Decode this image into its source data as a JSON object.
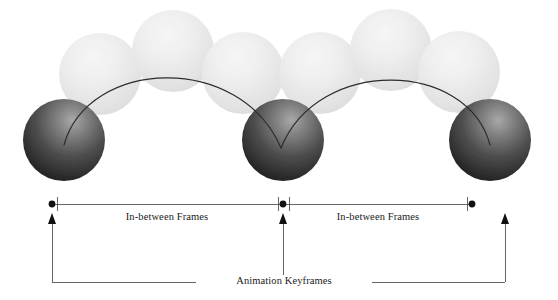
{
  "figure": {
    "type": "animation-keyframes-diagram",
    "background_color": "#ffffff",
    "width": 558,
    "height": 300
  },
  "labels": {
    "inbetween_left": "In-between Frames",
    "inbetween_right": "In-between Frames",
    "keyframes": "Animation Keyframes"
  },
  "colors": {
    "keyframe_ball_dark": "#1f1f1f",
    "keyframe_ball_highlight": "#9a9a9a",
    "inbetween_ball_light": "#e6e6e6",
    "inbetween_ball_highlight": "#f4f4f4",
    "trajectory_line": "#2b2b2b",
    "measure_line": "#555555",
    "bracket_line": "#555555",
    "marker_dot": "#111111",
    "text": "#1a1a1a"
  },
  "balls": {
    "keyframes": [
      {
        "name": "keyframe-ball-1",
        "cx": 64,
        "cy": 140,
        "r": 41
      },
      {
        "name": "keyframe-ball-2",
        "cx": 283,
        "cy": 140,
        "r": 41
      },
      {
        "name": "keyframe-ball-3",
        "cx": 490,
        "cy": 140,
        "r": 41
      }
    ],
    "inbetweens": [
      {
        "name": "inbetween-ball-1",
        "cx": 100,
        "cy": 74,
        "r": 41
      },
      {
        "name": "inbetween-ball-2",
        "cx": 173,
        "cy": 51,
        "r": 41
      },
      {
        "name": "inbetween-ball-3",
        "cx": 243,
        "cy": 73,
        "r": 41
      },
      {
        "name": "inbetween-ball-4",
        "cx": 320,
        "cy": 73,
        "r": 41
      },
      {
        "name": "inbetween-ball-5",
        "cx": 391,
        "cy": 50,
        "r": 41
      },
      {
        "name": "inbetween-ball-6",
        "cx": 459,
        "cy": 72,
        "r": 41
      }
    ]
  },
  "trajectories": [
    {
      "name": "arc-left",
      "path": "M 64 145 C 90 62, 240 55, 281 148"
    },
    {
      "name": "arc-right",
      "path": "M 281 148 C 318 58, 466 62, 490 145"
    }
  ],
  "measure_axis": {
    "y": 204,
    "x_start": 52,
    "x_mid": 283,
    "x_end": 472,
    "tick_half_height": 7,
    "dot_radius": 3.4,
    "segments": [
      {
        "name": "inbetween-span-left",
        "x1": 52,
        "x2": 283
      },
      {
        "name": "inbetween-span-right",
        "x1": 283,
        "x2": 472
      }
    ]
  },
  "keyframe_bracket": {
    "baseline_y": 282,
    "x_left": 52,
    "x_mid": 283,
    "x_right": 505,
    "arrow_top_y": 214,
    "label_gap_x1": 196,
    "label_gap_x2": 372
  }
}
